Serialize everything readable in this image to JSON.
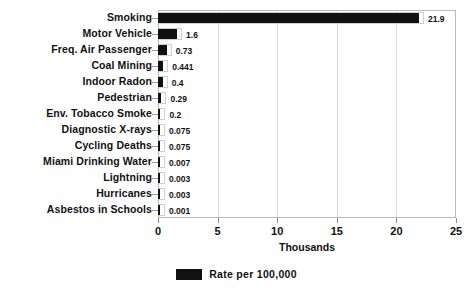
{
  "chart_data": {
    "type": "bar",
    "orientation": "horizontal",
    "title": "",
    "xlabel": "Thousands",
    "ylabel": "",
    "xlim": [
      0,
      25
    ],
    "xticks": [
      0,
      5,
      10,
      15,
      20,
      25
    ],
    "xtick_labels": [
      "0",
      "5",
      "10",
      "15",
      "20",
      "25"
    ],
    "grid": true,
    "grid_axis": "x",
    "legend": {
      "position": "bottom-center",
      "entries": [
        {
          "label": "Rate per 100,000",
          "color": "#111111"
        }
      ]
    },
    "categories": [
      "Smoking",
      "Motor Vehicle",
      "Freq. Air Passenger",
      "Coal Mining",
      "Indoor Radon",
      "Pedestrian",
      "Env. Tobacco Smoke",
      "Diagnostic X-rays",
      "Cycling Deaths",
      "Miami Drinking Water",
      "Lightning",
      "Hurricanes",
      "Asbestos in Schools"
    ],
    "values": [
      21.9,
      1.6,
      0.73,
      0.441,
      0.4,
      0.29,
      0.2,
      0.075,
      0.075,
      0.007,
      0.003,
      0.003,
      0.001
    ],
    "value_labels": [
      "21.9",
      "1.6",
      "0.73",
      "0.441",
      "0.4",
      "0.29",
      "0.2",
      "0.075",
      "0.075",
      "0.007",
      "0.003",
      "0.003",
      "0.001"
    ],
    "series": [
      {
        "name": "Rate per 100,000",
        "color": "#111111",
        "values": [
          21.9,
          1.6,
          0.73,
          0.441,
          0.4,
          0.29,
          0.2,
          0.075,
          0.075,
          0.007,
          0.003,
          0.003,
          0.001
        ]
      }
    ]
  },
  "colors": {
    "bar": "#111111",
    "bar_outline": "#cfcfcf",
    "gridline": "#d9d9d9",
    "axis": "#b9b9b9",
    "text": "#111111",
    "background": "#ffffff"
  }
}
